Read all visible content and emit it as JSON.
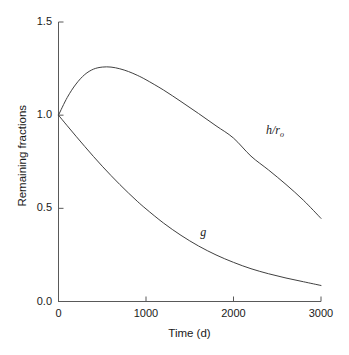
{
  "chart_data": {
    "type": "line",
    "title": "",
    "xlabel": "Time (d)",
    "ylabel": "Remaining fractions",
    "xlim": [
      0,
      3000
    ],
    "ylim": [
      0,
      1.5
    ],
    "grid": false,
    "legend_position": "inline-annotations",
    "xticks": [
      0,
      1000,
      2000,
      3000
    ],
    "xtick_labels": [
      "0",
      "1000",
      "2000",
      "3000"
    ],
    "yticks": [
      0.0,
      0.5,
      1.0,
      1.5
    ],
    "ytick_labels": [
      "0.0",
      "0.5",
      "1.0",
      "1.5"
    ],
    "series": [
      {
        "name": "h/r0",
        "label": "h/r",
        "label_sub": "o",
        "label_x": 2370,
        "label_y": 0.915,
        "color": "#404040",
        "x": [
          0,
          100,
          200,
          300,
          400,
          500,
          600,
          700,
          800,
          900,
          1000,
          1200,
          1400,
          1600,
          1800,
          2000,
          2200,
          2400,
          2600,
          2800,
          3000
        ],
        "y": [
          1.0,
          1.095,
          1.167,
          1.218,
          1.247,
          1.258,
          1.258,
          1.249,
          1.234,
          1.214,
          1.19,
          1.135,
          1.073,
          1.009,
          0.943,
          0.877,
          0.78,
          0.706,
          0.628,
          0.543,
          0.446
        ]
      },
      {
        "name": "g",
        "label": "g",
        "label_sub": "",
        "label_x": 1620,
        "label_y": 0.365,
        "color": "#404040",
        "x": [
          0,
          100,
          200,
          300,
          400,
          500,
          600,
          700,
          800,
          900,
          1000,
          1200,
          1400,
          1600,
          1800,
          2000,
          2200,
          2400,
          2600,
          2800,
          3000
        ],
        "y": [
          1.0,
          0.943,
          0.887,
          0.832,
          0.778,
          0.726,
          0.676,
          0.628,
          0.582,
          0.538,
          0.497,
          0.421,
          0.355,
          0.298,
          0.25,
          0.21,
          0.176,
          0.149,
          0.126,
          0.106,
          0.086
        ]
      }
    ]
  },
  "axes": {
    "y_title": "Remaining fractions",
    "x_title": "Time (d)"
  },
  "style": {
    "axis_color": "#595959",
    "curve_color": "#404040",
    "background": "#ffffff"
  }
}
